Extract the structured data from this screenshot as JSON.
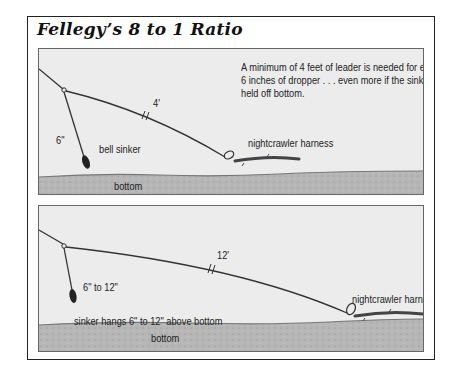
{
  "title": "Fellegy’s 8 to 1 Ratio",
  "colors": {
    "panel_bg": "#ececec",
    "bottom_fill": "#b4b4b4",
    "line": "#333333",
    "frame": "#222222"
  },
  "panels": [
    {
      "id": "dropper-on-bottom",
      "note": "A minimum of 4 feet of leader is needed for every 6 inches of dropper . . . even more if the sinker is held off bottom.",
      "labels": {
        "dropper_length": "6\"",
        "leader_length": "4'",
        "sinker": "bell sinker",
        "harness": "nightcrawler harness",
        "bottom": "bottom"
      }
    },
    {
      "id": "sinker-off-bottom",
      "labels": {
        "dropper_length": "6\" to 12\"",
        "leader_length": "12'",
        "sinker": "sinker hangs 6\" to 12\" above bottom",
        "harness": "nightcrawler harness",
        "bottom": "bottom"
      }
    }
  ]
}
